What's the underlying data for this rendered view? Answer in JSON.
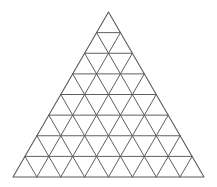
{
  "diagram": {
    "type": "triangular-grid",
    "shape": "equilateral-triangle",
    "subdivisions": 8,
    "small_triangles_up": 36,
    "small_triangles_down": 28,
    "vertices": {
      "apex": [
        108.5,
        12
      ],
      "bottom_left": [
        13,
        177
      ],
      "bottom_right": [
        204,
        177
      ]
    },
    "line_color": "#5f5f5f",
    "background_color": "#ffffff"
  }
}
